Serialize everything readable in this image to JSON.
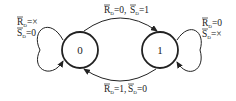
{
  "diagram": {
    "type": "state-transition",
    "states": [
      {
        "id": "s0",
        "label": "0"
      },
      {
        "id": "s1",
        "label": "1"
      }
    ],
    "transitions": [
      {
        "from": "s0",
        "to": "s1",
        "r_part": "R",
        "r_sub": "D",
        "r_val": "=0,",
        "s_part": "S",
        "s_sub": "D",
        "s_val": "=1"
      },
      {
        "from": "s1",
        "to": "s0",
        "r_part": "R",
        "r_sub": "D",
        "r_val": "=1,",
        "s_part": "S",
        "s_sub": "D",
        "s_val": "=0"
      }
    ],
    "self_loops": [
      {
        "state": "s0",
        "line1_var": "R",
        "line1_sub": "D",
        "line1_val": "=×",
        "line2_var": "S",
        "line2_sub": "D",
        "line2_val": "=0"
      },
      {
        "state": "s1",
        "line1_var": "R",
        "line1_sub": "D",
        "line1_val": "=0",
        "line2_var": "S",
        "line2_sub": "D",
        "line2_val": "=×"
      }
    ],
    "colors": {
      "stroke": "#222222",
      "background": "#ffffff"
    }
  }
}
